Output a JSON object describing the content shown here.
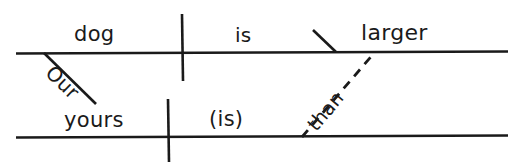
{
  "diagram": {
    "type": "reed-kellogg-sentence-diagram",
    "ink_color": "#1a1a1a",
    "background_color": "#ffffff",
    "main_clause": {
      "subject": "dog",
      "subject_modifier": "Our",
      "verb": "is",
      "complement": "larger"
    },
    "subordinate_clause": {
      "subject": "yours",
      "verb": "(is)",
      "conjunction": "than"
    }
  }
}
